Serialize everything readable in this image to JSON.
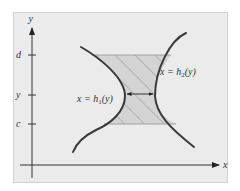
{
  "diagram": {
    "type": "region between two curves (type II region)",
    "axes": {
      "x_label": "x",
      "y_label": "y"
    },
    "y_ticks": [
      {
        "label": "d",
        "y": 55
      },
      {
        "label": "y",
        "y": 95
      },
      {
        "label": "c",
        "y": 124
      }
    ],
    "curves": [
      {
        "name": "h1",
        "label_prefix": "x = h",
        "label_sub": "1",
        "label_suffix": "(y)"
      },
      {
        "name": "h2",
        "label_prefix": "x = h",
        "label_sub": "2",
        "label_suffix": "(y)"
      }
    ],
    "colors": {
      "background_page": "#ffffff",
      "panel": "#ebebeb",
      "panel_border": "#d2d2d2",
      "curve": "#3a3a3a",
      "axis": "#333333",
      "shade_fill": "#d4d4d4",
      "hatch": "#8a8a8a",
      "region_edge": "#9a9a9a"
    }
  }
}
